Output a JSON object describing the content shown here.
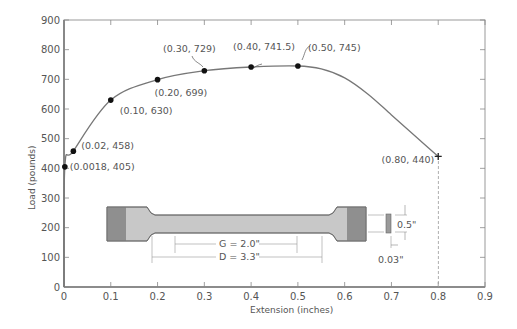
{
  "chart_data": {
    "type": "line",
    "title": "",
    "xlabel": "Extension   (inches)",
    "ylabel": "Load   (pounds)",
    "xlim": [
      0,
      0.9
    ],
    "ylim": [
      0,
      900
    ],
    "x_ticks": [
      "0",
      "0.1",
      "0.2",
      "0.3",
      "0.4",
      "0.5",
      "0.6",
      "0.7",
      "0.8",
      "0.9"
    ],
    "y_ticks": [
      "0",
      "100",
      "200",
      "300",
      "400",
      "500",
      "600",
      "700",
      "800",
      "900"
    ],
    "grid": false,
    "series": [
      {
        "name": "Load-extension curve",
        "x": [
          0,
          0.0018,
          0.02,
          0.1,
          0.2,
          0.3,
          0.4,
          0.5,
          0.55,
          0.6,
          0.65,
          0.7,
          0.75,
          0.8
        ],
        "y": [
          0,
          405,
          458,
          630,
          699,
          729,
          741.5,
          745,
          735,
          705,
          650,
          580,
          510,
          440
        ]
      }
    ],
    "labeled_points": [
      {
        "x": 0.0018,
        "y": 405,
        "label": "(0.0018, 405)",
        "marker": "dot"
      },
      {
        "x": 0.02,
        "y": 458,
        "label": "(0.02, 458)",
        "marker": "dot"
      },
      {
        "x": 0.1,
        "y": 630,
        "label": "(0.10, 630)",
        "marker": "dot"
      },
      {
        "x": 0.2,
        "y": 699,
        "label": "(0.20, 699)",
        "marker": "dot"
      },
      {
        "x": 0.3,
        "y": 729,
        "label": "(0.30, 729)",
        "marker": "dot"
      },
      {
        "x": 0.4,
        "y": 741.5,
        "label": "(0.40, 741.5)",
        "marker": "dot"
      },
      {
        "x": 0.5,
        "y": 745,
        "label": "(0.50, 745)",
        "marker": "dot"
      },
      {
        "x": 0.8,
        "y": 440,
        "label": "(0.80, 440)",
        "marker": "cross"
      }
    ],
    "annotations": {
      "specimen_gauge": "G = 2.0\"",
      "specimen_distance": "D = 3.3\"",
      "specimen_width": "0.5\"",
      "specimen_thickness": "0.03\""
    }
  }
}
